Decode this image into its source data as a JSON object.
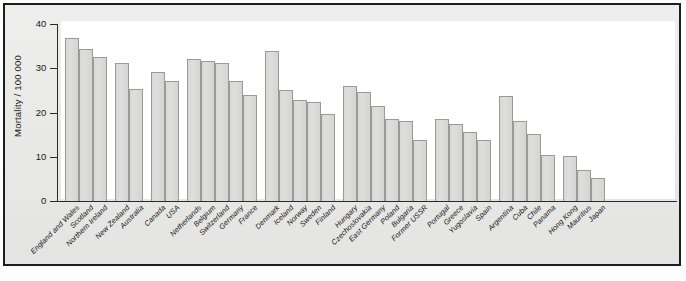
{
  "figure": {
    "caption": "",
    "colors": {
      "bar_fill": "#d8d8d6",
      "bar_stroke": "#9a9a99",
      "axis": "#2a2a2a",
      "panel": "#e9e9e7",
      "canvas": "#ffffff"
    }
  },
  "chart_data": {
    "type": "bar",
    "title": "",
    "subtitle": "",
    "xlabel": "",
    "ylabel": "Mortality / 100 000",
    "ylim": [
      0,
      40
    ],
    "yticks": [
      0,
      10,
      20,
      30,
      40
    ],
    "ytick_labels": [
      "0",
      "10",
      "20",
      "30",
      "40"
    ],
    "grid": false,
    "legend": false,
    "legend_position": "none",
    "categories": [
      "England and Wales",
      "Scotland",
      "Northern Ireland",
      "New Zealand",
      "Australia",
      "Canada",
      "USA",
      "Netherlands",
      "Belgium",
      "Switzerland",
      "Germany",
      "France",
      "Denmark",
      "Iceland",
      "Norway",
      "Sweden",
      "Finland",
      "Hungary",
      "Czechoslovakia",
      "East Germany",
      "Poland",
      "Bulgaria",
      "Former USSR",
      "Portugal",
      "Greece",
      "Yugoslavia",
      "Spain",
      "Argentina",
      "Cuba",
      "Chile",
      "Panama",
      "Hong Kong",
      "Mauritius",
      "Japan"
    ],
    "values": [
      36.8,
      34.3,
      32.5,
      31.1,
      25.4,
      29.1,
      27.1,
      32.0,
      31.6,
      31.1,
      27.2,
      23.9,
      34.0,
      25.0,
      22.9,
      22.4,
      19.7,
      26.0,
      24.6,
      21.4,
      18.5,
      18.0,
      13.8,
      18.6,
      17.4,
      15.6,
      13.9,
      23.7,
      18.0,
      15.2,
      10.3,
      10.1,
      7.1,
      5.3
    ],
    "groups": [
      {
        "name": "British Isles",
        "start": 0,
        "count": 3
      },
      {
        "name": "Oceania",
        "start": 3,
        "count": 2
      },
      {
        "name": "North America",
        "start": 5,
        "count": 2
      },
      {
        "name": "Western Europe",
        "start": 7,
        "count": 5
      },
      {
        "name": "Nordic",
        "start": 12,
        "count": 5
      },
      {
        "name": "Eastern Europe",
        "start": 17,
        "count": 6
      },
      {
        "name": "Southern Europe",
        "start": 23,
        "count": 4
      },
      {
        "name": "Latin America",
        "start": 27,
        "count": 4
      },
      {
        "name": "Asia and other",
        "start": 31,
        "count": 3
      }
    ]
  }
}
